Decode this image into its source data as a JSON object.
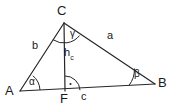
{
  "figure": {
    "kind": "geometry-diagram",
    "background_color": "#ffffff",
    "stroke_color": "#262626",
    "text_color": "#1a1a1a",
    "canvas": {
      "width": 173,
      "height": 109
    }
  },
  "vertices": [
    {
      "id": "A",
      "label": "A",
      "x": 20,
      "y": 91,
      "label_x": 5,
      "label_y": 86
    },
    {
      "id": "B",
      "label": "B",
      "x": 155,
      "y": 84,
      "label_x": 158,
      "label_y": 77
    },
    {
      "id": "C",
      "label": "C",
      "x": 64,
      "y": 23,
      "label_x": 57,
      "label_y": 4
    },
    {
      "id": "F",
      "label": "F",
      "x": 65,
      "y": 91,
      "label_x": 60,
      "label_y": 93
    }
  ],
  "sides": [
    {
      "id": "a",
      "label": "a",
      "from": "C",
      "to": "B",
      "label_x": 107,
      "label_y": 30
    },
    {
      "id": "b",
      "label": "b",
      "from": "A",
      "to": "C",
      "label_x": 32,
      "label_y": 40
    },
    {
      "id": "c",
      "label": "c",
      "from": "A",
      "to": "B",
      "label_x": 81,
      "label_y": 92
    }
  ],
  "altitude": {
    "id": "h_c",
    "label_main": "h",
    "label_sub": "c",
    "from": "C",
    "to": "F",
    "label_x": 64,
    "label_y": 47,
    "right_angle_marker": true
  },
  "angles": [
    {
      "id": "alpha",
      "label": "α",
      "at": "A",
      "radius": 20,
      "label_x": 29,
      "label_y": 77
    },
    {
      "id": "beta",
      "label": "β",
      "at": "B",
      "radius": 26,
      "label_x": 134,
      "label_y": 69
    },
    {
      "id": "gamma",
      "label": "γ",
      "at": "C",
      "radius": 20,
      "label_x": 70,
      "label_y": 30
    }
  ]
}
